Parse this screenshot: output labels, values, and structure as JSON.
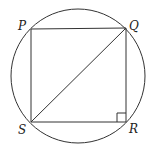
{
  "diagram": {
    "type": "geometry",
    "points": {
      "P": {
        "label": "P",
        "x": 31,
        "y": 29
      },
      "Q": {
        "label": "Q",
        "x": 126,
        "y": 28
      },
      "R": {
        "label": "R",
        "x": 126,
        "y": 122
      },
      "S": {
        "label": "S",
        "x": 31,
        "y": 122
      }
    },
    "circle": {
      "cx": 78,
      "cy": 76,
      "r": 67
    },
    "segments": [
      "PQ",
      "QR",
      "RS",
      "SP",
      "SQ"
    ],
    "right_angle_at": "R",
    "colors": {
      "stroke": "#333333",
      "background": "#ffffff"
    }
  }
}
